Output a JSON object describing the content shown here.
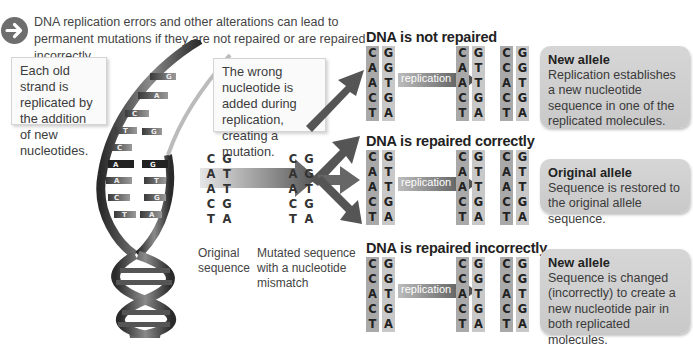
{
  "intro": {
    "icon": "arrow-right-circle-icon",
    "text": "DNA replication errors and other alterations can lead to permanent mutations if they are not repaired or are repaired incorrectly."
  },
  "callouts": {
    "old_strand": "Each old strand is replicated by the addition of new nucleotides.",
    "wrong_nucleotide": "The wrong nucleotide is added during replication, creating a mutation."
  },
  "helix_bases": {
    "left": [
      "C",
      "T",
      "C",
      "A",
      "A",
      "C",
      "T"
    ],
    "right": [
      "G",
      "A",
      "G",
      "G",
      "T",
      "G",
      "A"
    ]
  },
  "original": {
    "caption": "Original sequence",
    "left": [
      "C",
      "A",
      "A",
      "C",
      "T"
    ],
    "right": [
      "G",
      "T",
      "T",
      "G",
      "A"
    ]
  },
  "mutated": {
    "caption": "Mutated sequence with a nucleotide mismatch",
    "left": [
      "C",
      "A",
      "A",
      "C",
      "T"
    ],
    "right": [
      "G",
      "G",
      "T",
      "G",
      "A"
    ]
  },
  "scenarios": [
    {
      "title": "DNA is not repaired",
      "arrow_label": "replication",
      "start": {
        "left": [
          "C",
          "A",
          "A",
          "C",
          "T"
        ],
        "right": [
          "G",
          "G",
          "T",
          "G",
          "A"
        ]
      },
      "result1": {
        "left": [
          "C",
          "A",
          "A",
          "C",
          "T"
        ],
        "right": [
          "G",
          "T",
          "T",
          "G",
          "A"
        ]
      },
      "result2": {
        "left": [
          "C",
          "C",
          "A",
          "C",
          "T"
        ],
        "right": [
          "G",
          "G",
          "T",
          "G",
          "A"
        ]
      },
      "box_title": "New allele",
      "box_text": "Replication establishes a new nucleotide sequence in one of the replicated molecules."
    },
    {
      "title": "DNA is repaired correctly",
      "arrow_label": "replication",
      "start": {
        "left": [
          "C",
          "A",
          "A",
          "C",
          "T"
        ],
        "right": [
          "G",
          "T",
          "T",
          "G",
          "A"
        ]
      },
      "result1": {
        "left": [
          "C",
          "A",
          "A",
          "C",
          "T"
        ],
        "right": [
          "G",
          "T",
          "T",
          "G",
          "A"
        ]
      },
      "result2": {
        "left": [
          "C",
          "A",
          "A",
          "C",
          "T"
        ],
        "right": [
          "G",
          "T",
          "T",
          "G",
          "A"
        ]
      },
      "box_title": "Original allele",
      "box_text": "Sequence is restored to the original allele sequence."
    },
    {
      "title": "DNA is repaired incorrectly",
      "arrow_label": "replication",
      "start": {
        "left": [
          "C",
          "C",
          "A",
          "C",
          "T"
        ],
        "right": [
          "G",
          "G",
          "T",
          "G",
          "A"
        ]
      },
      "result1": {
        "left": [
          "C",
          "C",
          "A",
          "C",
          "T"
        ],
        "right": [
          "G",
          "G",
          "T",
          "G",
          "A"
        ]
      },
      "result2": {
        "left": [
          "C",
          "C",
          "A",
          "C",
          "T"
        ],
        "right": [
          "G",
          "G",
          "T",
          "G",
          "A"
        ]
      },
      "box_title": "New allele",
      "box_text": "Sequence is changed (incorrectly) to create a new nucleotide pair in both replicated molecules."
    }
  ],
  "colors": {
    "strand_dark": "#a9a9a9",
    "strand_light": "#c8c8c8",
    "result_box": "#cfcfcf",
    "arrow": "#5a5a5a"
  }
}
